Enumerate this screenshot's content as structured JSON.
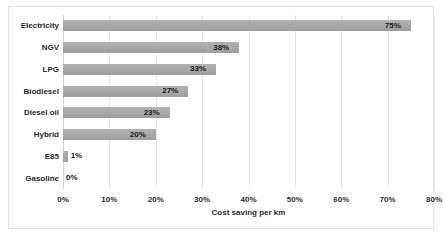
{
  "chart_data": {
    "type": "bar",
    "orientation": "horizontal",
    "title": "",
    "xlabel": "Cost saving per km",
    "ylabel": "",
    "categories": [
      "Electricity",
      "NGV",
      "LPG",
      "Biodiesel",
      "Diesel oil",
      "Hybrid",
      "E85",
      "Gasoline"
    ],
    "values": [
      75,
      38,
      33,
      27,
      23,
      20,
      1,
      0
    ],
    "data_labels": [
      "75%",
      "38%",
      "33%",
      "27%",
      "23%",
      "20%",
      "1%",
      "0%"
    ],
    "label_placement": [
      "inside",
      "inside",
      "inside",
      "inside",
      "inside",
      "inside",
      "outside",
      "outside"
    ],
    "xlim": [
      0,
      80
    ],
    "xticks": [
      0,
      10,
      20,
      30,
      40,
      50,
      60,
      70,
      80
    ],
    "xtick_labels": [
      "0%",
      "10%",
      "20%",
      "30%",
      "40%",
      "50%",
      "60%",
      "70%",
      "80%"
    ],
    "grid": "vertical",
    "legend": null,
    "bar_color": "#a9a9a9",
    "gridline_color": "#e8e8e8",
    "frame_color": "#e2e2e2",
    "text_color": "#2b2b2b",
    "background": "#ffffff"
  }
}
